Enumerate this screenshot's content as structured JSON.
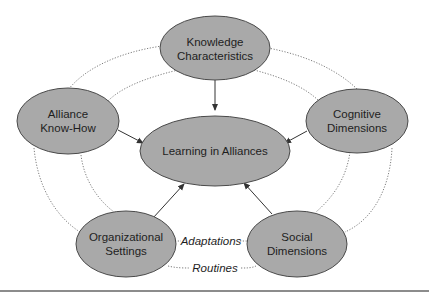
{
  "diagram": {
    "center_node": {
      "label": "Learning in Alliances"
    },
    "nodes": [
      {
        "id": "knowledge",
        "line1": "Knowledge",
        "line2": "Characteristics"
      },
      {
        "id": "alliance",
        "line1": "Alliance",
        "line2": "Know-How"
      },
      {
        "id": "cognitive",
        "line1": "Cognitive",
        "line2": "Dimensions"
      },
      {
        "id": "organizational",
        "line1": "Organizational",
        "line2": "Settings"
      },
      {
        "id": "social",
        "line1": "Social",
        "line2": "Dimensions"
      }
    ],
    "relations": [
      {
        "label": "Adaptations"
      },
      {
        "label": "Routines"
      }
    ],
    "colors": {
      "node_fill": "#a9a9a9",
      "node_stroke": "#4a4a4a",
      "text": "#1e1e1e",
      "rule": "#8c8c8c"
    }
  }
}
